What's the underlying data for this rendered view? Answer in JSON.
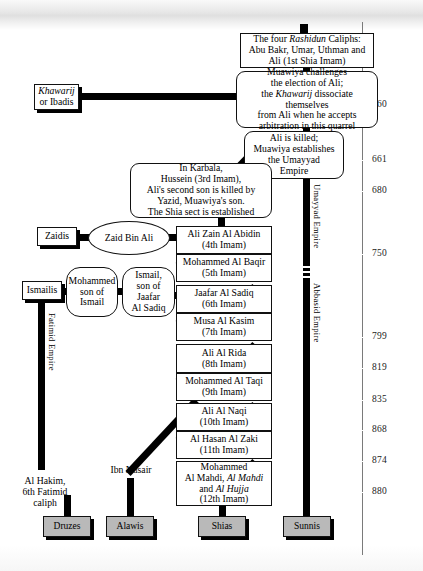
{
  "diagram": {
    "nodes": {
      "rashidun": "The four Rashidun Caliphs: Abu Bakr, Umar, Uthman and Ali (1st Shia Imam)",
      "rashidun_l1_a": "The four ",
      "rashidun_l1_b": "Rashidun",
      "rashidun_l1_c": " Caliphs:",
      "rashidun_l2": "Abu Bakr, Umar, Uthman and",
      "rashidun_l3": "Ali (1st Shia Imam)",
      "muawiya_l1": "Muawiya challenges",
      "muawiya_l2": "the election of Ali;",
      "muawiya_l3a": "the ",
      "muawiya_l3b": "Khawarij",
      "muawiya_l3c": " dissociate themselves",
      "muawiya_l4": "from Ali when he accepts",
      "muawiya_l5": "arbitration in this quarrel",
      "ali_killed_l1": "Ali is killed;",
      "ali_killed_l2": "Muawiya establishes",
      "ali_killed_l3": "the Umayyad",
      "ali_killed_l4": "Empire",
      "karbala_l1": "In Karbala,",
      "karbala_l2": "Hussein (3rd Imam),",
      "karbala_l3": "Ali's second son is killed by",
      "karbala_l4": "Yazid, Muawiya's son.",
      "karbala_l5": "The Shia sect is established",
      "khawarij_l1": "Khawarij",
      "khawarij_l2": "or Ibadis",
      "zaidis": "Zaidis",
      "zaid_bin_ali": "Zaid Bin Ali",
      "ismailis": "Ismailis",
      "mohammed_son_l1": "Mohammed",
      "mohammed_son_l2": "son of",
      "mohammed_son_l3": "Ismail",
      "ismail_son_l1": "Ismail,",
      "ismail_son_l2": "son of Jaafar",
      "ismail_son_l3": "Al Sadiq",
      "al_hakim_l1": "Al Hakim,",
      "al_hakim_l2": "6th Fatimid",
      "al_hakim_l3": "caliph",
      "ibn_nusair": "Ibn Nusair"
    },
    "imams": [
      {
        "name": "Ali Zain Al Abidin",
        "ordinal": "(4th Imam)"
      },
      {
        "name": "Mohammed Al Baqir",
        "ordinal": "(5th Imam)"
      },
      {
        "name": "Jaafar Al Sadiq",
        "ordinal": "(6th Imam)"
      },
      {
        "name": "Musa Al Kasim",
        "ordinal": "(7th Imam)"
      },
      {
        "name": "Ali Al Rida",
        "ordinal": "(8th Imam)"
      },
      {
        "name": "Mohammed Al Taqi",
        "ordinal": "(9th Imam)"
      },
      {
        "name": "Ali Al Naqi",
        "ordinal": "(10th Imam)"
      },
      {
        "name": "Al Hasan Al Zaki",
        "ordinal": "(11th Imam)"
      }
    ],
    "imam12": {
      "l1": "Mohammed",
      "l2a": "Al Mahdi, ",
      "l2b": "Al Mahdi",
      "l3a": "and ",
      "l3b": "Al Hujja",
      "l4": "(12th Imam)"
    },
    "empires": {
      "umayyad": "Umayyad Empire",
      "abbasid": "Abbasid Empire",
      "fatimid": "Fatimid Empire"
    },
    "sects": [
      {
        "label": "Druzes"
      },
      {
        "label": "Alawis"
      },
      {
        "label": "Shias"
      },
      {
        "label": "Sunnis"
      }
    ],
    "timeline": {
      "dates": [
        "660",
        "661",
        "680",
        "750",
        "799",
        "819",
        "835",
        "868",
        "874",
        "880"
      ]
    },
    "colors": {
      "ink": "#000000",
      "sect_fill": "#b9b9b9",
      "timeline": "#7a7a7a",
      "paper": "#ffffff"
    }
  }
}
